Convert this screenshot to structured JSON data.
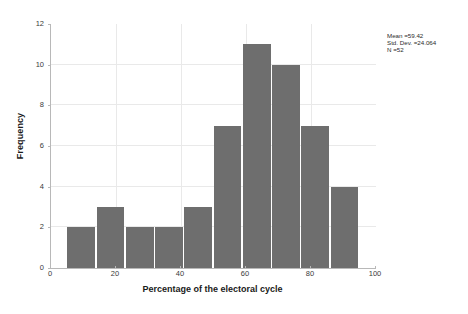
{
  "chart_data": {
    "type": "bar",
    "title": "",
    "xlabel": "Percentage of the electoral cycle",
    "ylabel": "Frequency",
    "categories": [
      "5-14",
      "14-23",
      "23-32",
      "32-41",
      "41-50",
      "50-59",
      "59-68",
      "68-77",
      "77-86",
      "86-95"
    ],
    "bin_edges": [
      5,
      14,
      23,
      32,
      41,
      50,
      59,
      68,
      77,
      86,
      95
    ],
    "values": [
      2,
      3,
      2,
      2,
      3,
      7,
      11,
      10,
      7,
      4
    ],
    "xlim": [
      0,
      100
    ],
    "ylim": [
      0,
      12
    ],
    "xticks": [
      0,
      20,
      40,
      60,
      80,
      100
    ],
    "yticks": [
      0,
      2,
      4,
      6,
      8,
      10,
      12
    ],
    "xtick_labels": [
      "0",
      "20",
      "40",
      "60",
      "80",
      "100"
    ],
    "ytick_labels": [
      "0",
      "2",
      "4",
      "6",
      "8",
      "10",
      "12"
    ],
    "grid": true,
    "legend": false,
    "bar_color": "#6e6e6e",
    "grid_color": "#e9e9e9",
    "axis_color": "#b8b8b8",
    "background": "#ffffff"
  },
  "annotation": {
    "mean_line": "Mean =59.42",
    "stddev_line": "Std. Dev. =24.064",
    "n_line": "N =52"
  }
}
